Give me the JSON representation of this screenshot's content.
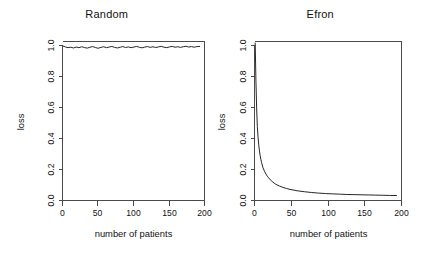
{
  "figure": {
    "background": "#ffffff",
    "line_color": "#262626",
    "axis_color": "#4a4a4a",
    "panel_count": 2
  },
  "chart_data": [
    {
      "type": "line",
      "title": "Random",
      "xlabel": "number of patients",
      "ylabel": "loss",
      "xlim": [
        0,
        207
      ],
      "ylim": [
        0.0,
        1.03
      ],
      "xticks": [
        0,
        50,
        100,
        150,
        200
      ],
      "xticklabels": [
        "0",
        "50",
        "100",
        "150",
        "200"
      ],
      "yticks": [
        0.0,
        0.2,
        0.4,
        0.6,
        0.8,
        1.0
      ],
      "yticklabels": [
        "0.0",
        "0.2",
        "0.4",
        "0.6",
        "0.8",
        "1.0"
      ],
      "grid": false,
      "legend": "none",
      "x": [
        1,
        4,
        8,
        12,
        16,
        20,
        24,
        28,
        32,
        36,
        40,
        44,
        48,
        52,
        56,
        60,
        64,
        68,
        72,
        76,
        80,
        84,
        88,
        92,
        96,
        100,
        104,
        108,
        112,
        116,
        120,
        124,
        128,
        132,
        136,
        140,
        144,
        148,
        152,
        156,
        160,
        164,
        168,
        172,
        176,
        180,
        184,
        188,
        192,
        196,
        200
      ],
      "values": [
        1.0,
        0.995,
        0.99,
        0.993,
        0.988,
        0.994,
        0.99,
        0.996,
        0.991,
        0.987,
        0.993,
        0.997,
        0.991,
        0.986,
        0.992,
        0.996,
        0.99,
        0.994,
        0.998,
        0.992,
        0.988,
        0.993,
        0.997,
        0.991,
        0.995,
        0.99,
        0.994,
        0.998,
        0.993,
        0.989,
        0.994,
        0.997,
        0.992,
        0.996,
        0.991,
        0.995,
        0.999,
        0.993,
        0.99,
        0.995,
        0.998,
        0.993,
        0.996,
        0.992,
        0.996,
        0.999,
        0.994,
        0.997,
        0.993,
        0.997,
        0.998
      ]
    },
    {
      "type": "line",
      "title": "Efron",
      "xlabel": "number of patients",
      "ylabel": "loss",
      "xlim": [
        0,
        207
      ],
      "ylim": [
        0.0,
        1.03
      ],
      "xticks": [
        0,
        50,
        100,
        150,
        200
      ],
      "xticklabels": [
        "0",
        "50",
        "100",
        "150",
        "200"
      ],
      "yticks": [
        0.0,
        0.2,
        0.4,
        0.6,
        0.8,
        1.0
      ],
      "yticklabels": [
        "0.0",
        "0.2",
        "0.4",
        "0.6",
        "0.8",
        "1.0"
      ],
      "grid": false,
      "legend": "none",
      "x": [
        1,
        2,
        3,
        4,
        5,
        6,
        7,
        8,
        9,
        10,
        12,
        14,
        16,
        18,
        20,
        25,
        30,
        35,
        40,
        45,
        50,
        60,
        70,
        80,
        90,
        100,
        110,
        120,
        130,
        140,
        150,
        160,
        170,
        180,
        190,
        200
      ],
      "values": [
        1.02,
        0.78,
        0.6,
        0.48,
        0.41,
        0.36,
        0.32,
        0.29,
        0.265,
        0.245,
        0.212,
        0.19,
        0.172,
        0.158,
        0.146,
        0.122,
        0.105,
        0.094,
        0.085,
        0.078,
        0.072,
        0.063,
        0.057,
        0.052,
        0.048,
        0.045,
        0.043,
        0.041,
        0.039,
        0.038,
        0.037,
        0.036,
        0.035,
        0.034,
        0.033,
        0.032
      ]
    }
  ]
}
